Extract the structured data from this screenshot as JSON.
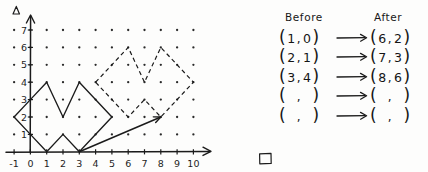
{
  "graph": {
    "name": "coordinate-grid-translation-figure",
    "x_axis": {
      "label_ticks": [
        "-1",
        "0",
        "1",
        "2",
        "3",
        "4",
        "5",
        "6",
        "7",
        "8",
        "9",
        "10"
      ],
      "min": -1,
      "max": 10,
      "arrow": true
    },
    "y_axis": {
      "label_ticks": [
        "1",
        "2",
        "3",
        "4",
        "5",
        "6",
        "7"
      ],
      "min": 0,
      "max": 7.6,
      "arrow": true
    },
    "grid_dots": true,
    "preimage": {
      "name": "solid-crown-polygon",
      "style": "solid",
      "points": [
        [
          -1,
          2
        ],
        [
          0,
          3
        ],
        [
          1,
          4
        ],
        [
          2,
          2
        ],
        [
          3,
          4
        ],
        [
          5,
          2
        ],
        [
          3,
          0
        ],
        [
          2,
          1
        ],
        [
          1,
          0
        ],
        [
          0,
          1
        ]
      ]
    },
    "image": {
      "name": "dashed-crown-polygon",
      "style": "dashed",
      "points": [
        [
          4,
          4
        ],
        [
          5,
          5
        ],
        [
          6,
          6
        ],
        [
          7,
          4
        ],
        [
          8,
          6
        ],
        [
          10,
          4
        ],
        [
          8,
          2
        ],
        [
          7,
          3
        ],
        [
          6,
          2
        ],
        [
          5,
          3
        ]
      ]
    },
    "translation_vector": {
      "name": "translation-arrow",
      "from": [
        3,
        0
      ],
      "to": [
        8,
        2
      ],
      "dx": 5,
      "dy": 2
    },
    "triangle_marker": "triangle-marker"
  },
  "table": {
    "headers": {
      "before": "Before",
      "after": "After"
    },
    "arrow_glyph": "⟶",
    "rows": [
      {
        "before_x": "1",
        "before_y": "0",
        "after_x": "6",
        "after_y": "2"
      },
      {
        "before_x": "2",
        "before_y": "1",
        "after_x": "7",
        "after_y": "3"
      },
      {
        "before_x": "3",
        "before_y": "4",
        "after_x": "8",
        "after_y": "6"
      },
      {
        "before_x": "",
        "before_y": "",
        "after_x": "",
        "after_y": ""
      },
      {
        "before_x": "",
        "before_y": "",
        "after_x": "",
        "after_y": ""
      }
    ],
    "open_paren": "(",
    "close_paren": ")",
    "comma": ","
  },
  "colors": {
    "ink": "#1b1b1b",
    "paper": "#fdfdfc"
  }
}
